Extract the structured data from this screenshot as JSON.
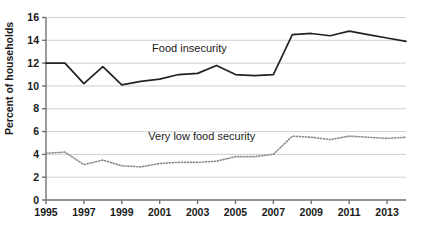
{
  "chart_data": {
    "type": "line",
    "title": "",
    "subtitle": "",
    "xlabel": "",
    "ylabel": "Percent of households",
    "xlim": [
      1995,
      2014
    ],
    "ylim": [
      0,
      16
    ],
    "ytick_values": [
      0,
      2,
      4,
      6,
      8,
      10,
      12,
      14,
      16
    ],
    "ytick_labels": [
      "0",
      "2",
      "4",
      "6",
      "8",
      "10",
      "12",
      "14",
      "16"
    ],
    "xtick_values": [
      1995,
      1997,
      1999,
      2001,
      2003,
      2005,
      2007,
      2009,
      2011,
      2013
    ],
    "xtick_labels": [
      "1995",
      "1997",
      "1999",
      "2001",
      "2003",
      "2005",
      "2007",
      "2009",
      "2011",
      "2013"
    ],
    "x": [
      1995,
      1996,
      1997,
      1998,
      1999,
      2000,
      2001,
      2002,
      2003,
      2004,
      2005,
      2006,
      2007,
      2008,
      2009,
      2010,
      2011,
      2012,
      2013,
      2014
    ],
    "grid": "horizontal",
    "legend_position": "inline-annotation",
    "series": [
      {
        "name": "Food insecurity",
        "style": "solid",
        "color": "#222222",
        "label_x": 2000.6,
        "label_y": 13.0,
        "values": [
          12.0,
          12.0,
          10.2,
          11.7,
          10.1,
          10.4,
          10.6,
          11.0,
          11.1,
          11.8,
          11.0,
          10.9,
          11.0,
          14.5,
          14.6,
          14.4,
          14.8,
          14.5,
          14.2,
          13.9
        ]
      },
      {
        "name": "Very low food security",
        "style": "dotted",
        "color": "#8a8a8a",
        "label_x": 2000.4,
        "label_y": 5.3,
        "values": [
          4.1,
          4.2,
          3.1,
          3.5,
          3.0,
          2.9,
          3.2,
          3.3,
          3.3,
          3.4,
          3.8,
          3.8,
          4.0,
          5.6,
          5.5,
          5.3,
          5.6,
          5.5,
          5.4,
          5.5
        ]
      }
    ]
  },
  "axis": {
    "y_title": "Percent of households"
  },
  "annotations": {
    "food_insecurity": "Food insecurity",
    "very_low_food_security": "Very low food security"
  }
}
